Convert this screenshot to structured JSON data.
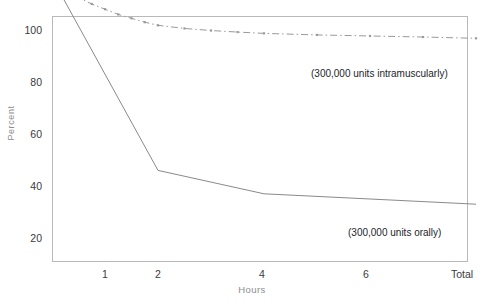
{
  "chart_data": {
    "type": "line",
    "title": "",
    "subtitle": "",
    "xlabel": "Hours",
    "ylabel": "Percent",
    "xtick_labels": [
      "1",
      "2",
      "4",
      "6",
      "Total"
    ],
    "ytick_labels": [
      "20",
      "40",
      "60",
      "80",
      "100"
    ],
    "ylim": [
      0,
      108
    ],
    "xlim_hours": [
      0,
      8
    ],
    "grid": false,
    "legend_position": "inline-annotations",
    "annotations": [
      "(300,000 units intramuscularly)",
      "(300,000 units orally)"
    ],
    "series": [
      {
        "name": "(300,000 units intramuscularly)",
        "style": "solid",
        "color": "#8a8a8a",
        "x_hours": [
          0,
          2,
          4,
          8
        ],
        "x_labels": [
          "0",
          "2",
          "4",
          "Total"
        ],
        "values": [
          0,
          74,
          83,
          87
        ]
      },
      {
        "name": "(300,000 units orally)",
        "style": "dash-dot",
        "color": "#9a9a9a",
        "x_hours": [
          0,
          0.25,
          0.5,
          0.75,
          1,
          1.25,
          1.5,
          1.75,
          2,
          2.5,
          3,
          3.5,
          4,
          5,
          6,
          7,
          8
        ],
        "x_labels": [
          "0",
          "",
          "",
          "",
          "1",
          "",
          "",
          "",
          "2",
          "",
          "",
          "",
          "4",
          "",
          "6",
          "",
          "Total"
        ],
        "values": [
          0,
          4.5,
          7.5,
          10,
          12,
          14,
          15.5,
          17,
          18.2,
          19.4,
          20.2,
          20.8,
          21.3,
          21.9,
          22.3,
          22.7,
          23.2
        ]
      }
    ]
  },
  "axes": {
    "ytick_positions_px": [
      30,
      82,
      134,
      186,
      238
    ],
    "xtick_positions_px": [
      105,
      158,
      262,
      366,
      468
    ]
  },
  "colors": {
    "axis": "#b9b9b9",
    "tick_text": "#3a3a3a",
    "axis_label": "#8d8d8d",
    "series_1": "#8a8a8a",
    "series_2": "#9a9a9a",
    "background": "#ffffff"
  },
  "annotation_labels": {
    "intramuscular": "(300,000 units intramuscularly)",
    "oral": "(300,000 units orally)"
  }
}
